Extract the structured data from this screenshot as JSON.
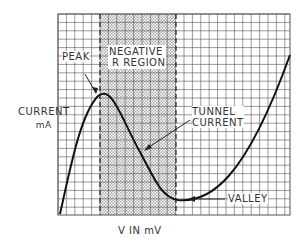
{
  "labels": {
    "peak": "PEAK",
    "negative_line1": "NEGATIVE",
    "negative_line2": "R REGION",
    "current_line1": "CURRENT",
    "current_line2": "mA",
    "tunnel_line1": "TUNNEL",
    "tunnel_line2": "CURRENT",
    "valley": "VALLEY",
    "xaxis": "V IN mV"
  },
  "colors": {
    "grid": "#555555",
    "curve": "#111111",
    "shade": "#bbbbbb",
    "text": "#333333"
  },
  "chart_data": {
    "type": "line",
    "xlabel": "V IN mV",
    "ylabel": "CURRENT mA",
    "grid": true,
    "annotations": [
      "PEAK",
      "NEGATIVE R REGION",
      "TUNNEL CURRENT",
      "VALLEY"
    ],
    "shaded_region": "negative resistance region between peak and valley voltages"
  }
}
